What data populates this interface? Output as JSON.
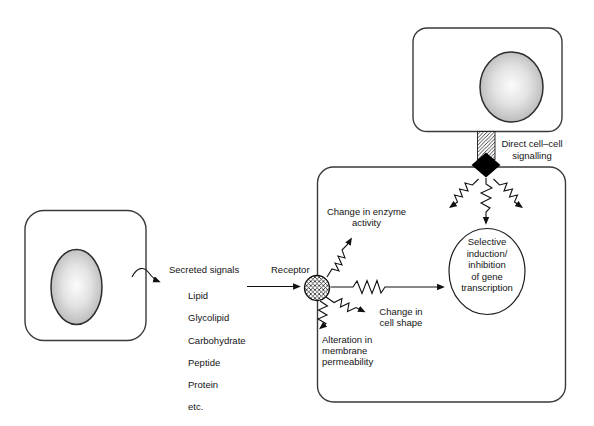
{
  "figure": {
    "background_color": "#ffffff",
    "colors": {
      "line": "#1a1a1a",
      "cell_outline": "#3a3a3a",
      "text": "#141414",
      "nucleus_center": "#fcfcfc",
      "nucleus_edge": "#989898",
      "diamond_fill": "#000000"
    },
    "icons": {
      "receptor_icon": "crosshatch-circle",
      "gap_junction_icon": "diagonal-hatch-bar",
      "junction_node_icon": "filled-black-diamond",
      "signal_path_icon": "zigzag-arrow",
      "secretion_icon": "curved-squiggle-arrow"
    },
    "labels": {
      "secreted_signals_heading": "Secreted signals",
      "signal_types": [
        "Lipid",
        "Glycolipid",
        "Carbohydrate",
        "Peptide",
        "Protein",
        "etc."
      ],
      "receptor": "Receptor",
      "change_enzyme_activity": "Change in enzyme\nactivity",
      "change_cell_shape": "Change in\ncell shape",
      "alteration_membrane": "Alteration in\nmembrane\npermeability",
      "selective_transcription": "Selective\ninduction/\ninhibition\nof gene\ntranscription",
      "direct_cell_cell": "Direct cell–cell\nsignalling"
    }
  }
}
